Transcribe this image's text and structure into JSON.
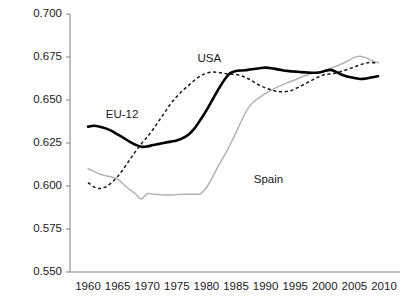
{
  "chart_data": {
    "type": "line",
    "title": "",
    "subtitle": "",
    "xlabel": "",
    "ylabel": "",
    "xlim": [
      1959,
      2010
    ],
    "ylim": [
      0.55,
      0.7
    ],
    "grid": false,
    "legend_position": "inline-annotations",
    "x_ticks": [
      1960,
      1965,
      1970,
      1975,
      1980,
      1985,
      1990,
      1995,
      2000,
      2005,
      2010
    ],
    "x_tick_labels": [
      "1960",
      "1965",
      "1970",
      "1975",
      "1980",
      "1985",
      "1990",
      "1995",
      "2000",
      "2005",
      "2010"
    ],
    "y_ticks": [
      0.55,
      0.575,
      0.6,
      0.625,
      0.65,
      0.675,
      0.7
    ],
    "y_tick_labels": [
      "0.550",
      "0.575",
      "0.600",
      "0.625",
      "0.650",
      "0.675",
      "0.700"
    ],
    "series": [
      {
        "name": "EU-12",
        "style": "solid-thick-black",
        "color": "#000000",
        "label_x": 1963,
        "label_y": 0.6415,
        "x": [
          1960,
          1961,
          1962,
          1963,
          1964,
          1965,
          1966,
          1967,
          1968,
          1969,
          1970,
          1971,
          1972,
          1973,
          1974,
          1975,
          1976,
          1977,
          1978,
          1979,
          1980,
          1981,
          1982,
          1983,
          1984,
          1985,
          1986,
          1987,
          1988,
          1989,
          1990,
          1991,
          1992,
          1993,
          1994,
          1995,
          1996,
          1997,
          1998,
          1999,
          2000,
          2001,
          2002,
          2003,
          2004,
          2005,
          2006,
          2007,
          2008,
          2009
        ],
        "y": [
          0.6345,
          0.635,
          0.6345,
          0.6335,
          0.632,
          0.63,
          0.628,
          0.6258,
          0.624,
          0.6228,
          0.623,
          0.6238,
          0.6245,
          0.6252,
          0.6258,
          0.6265,
          0.6278,
          0.63,
          0.6335,
          0.6385,
          0.644,
          0.65,
          0.656,
          0.6615,
          0.6655,
          0.6668,
          0.6672,
          0.6675,
          0.668,
          0.6685,
          0.6688,
          0.6685,
          0.6678,
          0.6672,
          0.6668,
          0.6665,
          0.6662,
          0.666,
          0.6658,
          0.666,
          0.6668,
          0.6675,
          0.6662,
          0.6645,
          0.6635,
          0.6628,
          0.6622,
          0.6625,
          0.6632,
          0.6638
        ]
      },
      {
        "name": "USA",
        "style": "dashed-black",
        "color": "#1a1a1a",
        "label_x": 1978.5,
        "label_y": 0.674,
        "x": [
          1960,
          1961,
          1962,
          1963,
          1964,
          1965,
          1966,
          1967,
          1968,
          1969,
          1970,
          1971,
          1972,
          1973,
          1974,
          1975,
          1976,
          1977,
          1978,
          1979,
          1980,
          1981,
          1982,
          1983,
          1984,
          1985,
          1986,
          1987,
          1988,
          1989,
          1990,
          1991,
          1992,
          1993,
          1994,
          1995,
          1996,
          1997,
          1998,
          1999,
          2000,
          2001,
          2002,
          2003,
          2004,
          2005,
          2006,
          2007,
          2008,
          2009
        ],
        "y": [
          0.602,
          0.5995,
          0.5985,
          0.5995,
          0.602,
          0.6055,
          0.61,
          0.615,
          0.62,
          0.6245,
          0.6285,
          0.633,
          0.638,
          0.643,
          0.648,
          0.652,
          0.6555,
          0.6585,
          0.6615,
          0.664,
          0.6655,
          0.6662,
          0.666,
          0.6655,
          0.665,
          0.6648,
          0.664,
          0.6625,
          0.6605,
          0.6585,
          0.657,
          0.6558,
          0.655,
          0.6548,
          0.6552,
          0.6565,
          0.6582,
          0.66,
          0.6618,
          0.6635,
          0.6648,
          0.6652,
          0.6658,
          0.6668,
          0.668,
          0.6692,
          0.6705,
          0.6715,
          0.6718,
          0.6712
        ]
      },
      {
        "name": "Spain",
        "style": "solid-thin-gray",
        "color": "#b3b3b3",
        "label_x": 1988,
        "label_y": 0.6035,
        "x": [
          1960,
          1961,
          1962,
          1963,
          1964,
          1965,
          1966,
          1967,
          1968,
          1969,
          1970,
          1971,
          1972,
          1973,
          1974,
          1975,
          1976,
          1977,
          1978,
          1979,
          1980,
          1981,
          1982,
          1983,
          1984,
          1985,
          1986,
          1987,
          1988,
          1989,
          1990,
          1991,
          1992,
          1993,
          1994,
          1995,
          1996,
          1997,
          1998,
          1999,
          2000,
          2001,
          2002,
          2003,
          2004,
          2005,
          2006,
          2007,
          2008,
          2009
        ],
        "y": [
          0.6102,
          0.6085,
          0.607,
          0.606,
          0.6052,
          0.604,
          0.601,
          0.598,
          0.5955,
          0.5925,
          0.5955,
          0.5952,
          0.595,
          0.5948,
          0.5948,
          0.595,
          0.5952,
          0.5952,
          0.5952,
          0.5955,
          0.599,
          0.605,
          0.6115,
          0.6175,
          0.624,
          0.631,
          0.6385,
          0.645,
          0.649,
          0.6515,
          0.6538,
          0.6558,
          0.6575,
          0.659,
          0.6605,
          0.6618,
          0.6632,
          0.6645,
          0.6655,
          0.6662,
          0.6672,
          0.6685,
          0.6698,
          0.6712,
          0.673,
          0.6748,
          0.6755,
          0.6745,
          0.6728,
          0.6718
        ]
      }
    ]
  }
}
